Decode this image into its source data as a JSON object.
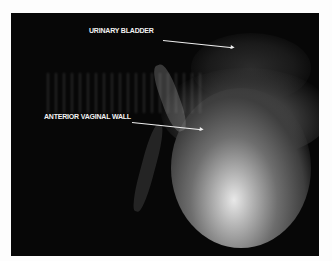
{
  "figure": {
    "annotations": [
      {
        "label": "URINARY BLADDER"
      },
      {
        "label": "ANTERIOR VAGINAL WALL"
      }
    ],
    "colors": {
      "background": "#070707",
      "annotation": "#f2f2f2",
      "page": "#fdfdfd"
    }
  }
}
